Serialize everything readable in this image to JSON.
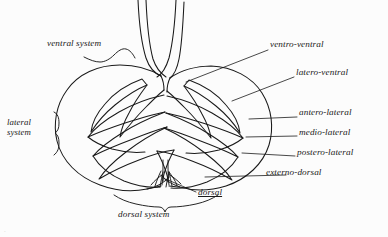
{
  "figure": {
    "background_color": "#fcfcfc",
    "ink_color": "#1a1a1a"
  },
  "labels": {
    "ventral_system": "ventral system",
    "lateral_system_line1": "lateral",
    "lateral_system_line2": "system",
    "dorsal_system": "dorsal system",
    "dorsal": "dorsal",
    "ventro_ventral": "ventro-ventral",
    "latero_ventral": "latero-ventral",
    "antero_lateral": "antero-lateral",
    "medio_lateral": "medio-lateral",
    "postero_lateral": "postero-lateral",
    "externo_dorsal": "externo-dorsal"
  },
  "caption": {
    "text": "."
  }
}
